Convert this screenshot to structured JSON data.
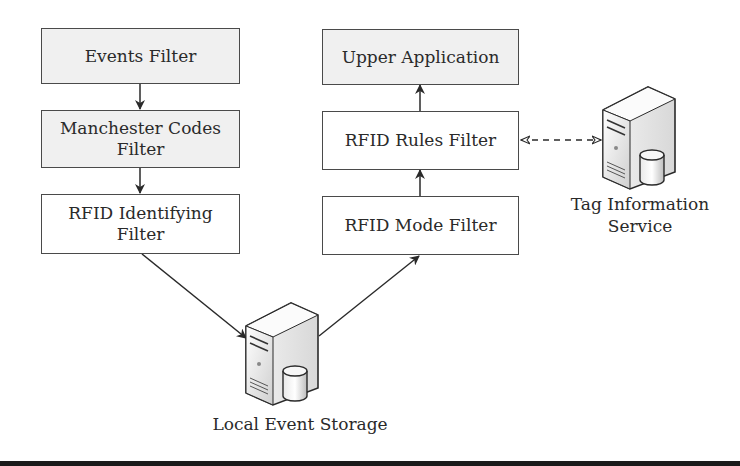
{
  "diagram": {
    "nodes": {
      "events_filter": "Events Filter",
      "manchester_filter": "Manchester Codes Filter",
      "rfid_identifying_filter": "RFID Identifying Filter",
      "upper_application": "Upper Application",
      "rfid_rules_filter": "RFID Rules Filter",
      "rfid_mode_filter": "RFID Mode Filter",
      "local_event_storage": "Local Event Storage",
      "tag_information_service": "Tag Information Service"
    },
    "labels": {
      "manchester_line1": "Manchester Codes",
      "manchester_line2": "Filter",
      "identifying_line1": "RFID Identifying",
      "identifying_line2": "Filter",
      "tag_line1": "Tag Information",
      "tag_line2": "Service"
    },
    "edges": [
      {
        "from": "Events Filter",
        "to": "Manchester Codes Filter",
        "style": "solid"
      },
      {
        "from": "Manchester Codes Filter",
        "to": "RFID Identifying Filter",
        "style": "solid"
      },
      {
        "from": "RFID Identifying Filter",
        "to": "Local Event Storage",
        "style": "solid"
      },
      {
        "from": "Local Event Storage",
        "to": "RFID Mode Filter",
        "style": "solid"
      },
      {
        "from": "RFID Mode Filter",
        "to": "RFID Rules Filter",
        "style": "solid"
      },
      {
        "from": "RFID Rules Filter",
        "to": "Upper Application",
        "style": "solid"
      },
      {
        "from": "RFID Rules Filter",
        "to": "Tag Information Service",
        "style": "dashed",
        "bidirectional": true
      }
    ],
    "icons": {
      "local_event_storage": "server-database-icon",
      "tag_information_service": "server-database-icon"
    },
    "colors": {
      "gray_box_fill": "#f0f0f0",
      "border": "#4a4a4a",
      "arrow": "#2a2a2a"
    }
  }
}
